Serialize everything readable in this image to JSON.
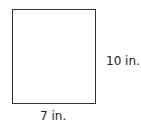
{
  "diagram": {
    "shape": "rectangle",
    "height_label": "10 in.",
    "width_label": "7 in.",
    "stroke_color": "#333333"
  }
}
